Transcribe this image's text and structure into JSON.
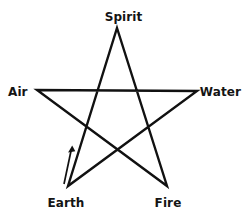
{
  "diagram": {
    "background_color": "#ffffff",
    "stroke_color": "#111111",
    "stroke_width": 2.4,
    "label_color": "#141414",
    "shape": "pentagram",
    "vertices": [
      {
        "id": "spirit",
        "label": "Spirit",
        "position": "top",
        "x": 117,
        "y": 28
      },
      {
        "id": "water",
        "label": "Water",
        "position": "right",
        "x": 197,
        "y": 91
      },
      {
        "id": "fire",
        "label": "Fire",
        "position": "bottom-right",
        "x": 167,
        "y": 186
      },
      {
        "id": "earth",
        "label": "Earth",
        "position": "bottom-left",
        "x": 68,
        "y": 186
      },
      {
        "id": "air",
        "label": "Air",
        "position": "left",
        "x": 37,
        "y": 90
      }
    ],
    "star_path": "M 117,28 L 167,186 L 37,90 L 197,91 L 68,186 Z",
    "direction_arrow": {
      "id": "earth-to-spirit-arrow",
      "description": "arrow indicating tracing direction from Earth toward Spirit",
      "x1": 64,
      "y1": 184,
      "x2": 72,
      "y2": 146,
      "head_size": 6
    }
  }
}
